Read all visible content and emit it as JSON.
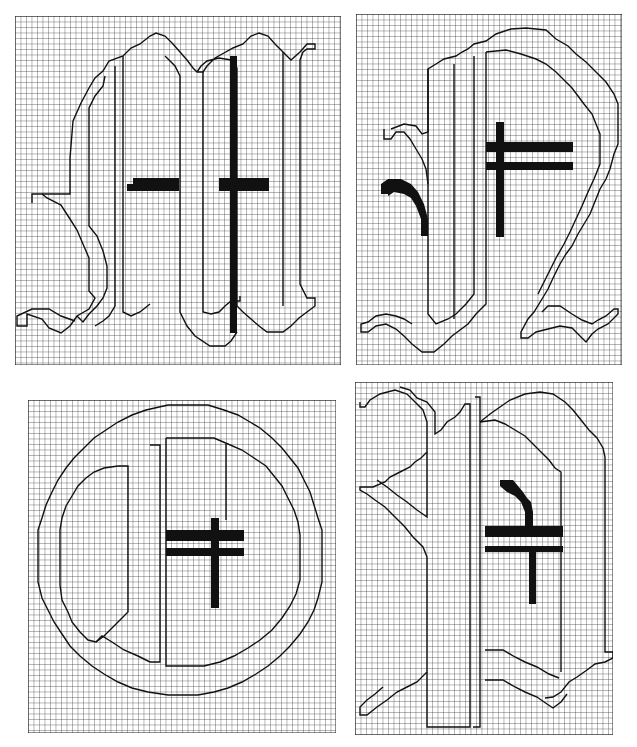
{
  "figure": {
    "colors": {
      "background": "#ffffff",
      "grid": "#222222",
      "outline": "#111111",
      "fill": "#111111"
    },
    "panels": [
      {
        "id": "top-left",
        "label": "M-like glyph with crossbars",
        "cell": 5.5
      },
      {
        "id": "top-right",
        "label": "R/Q-like glyph with double crossbar and hook",
        "cell": 5.5
      },
      {
        "id": "bottom-left",
        "label": "O-like round glyph with double crossbar",
        "cell": 5.5
      },
      {
        "id": "bottom-right",
        "label": "Scroll-like glyph with double crossbar and hook",
        "cell": 5.5
      }
    ]
  }
}
